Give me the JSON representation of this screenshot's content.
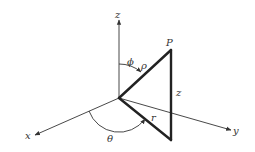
{
  "diagram": {
    "labels": {
      "z_axis": "z",
      "x_axis": "x",
      "y_axis": "y",
      "point": "P",
      "phi": "ϕ",
      "rho": "ρ",
      "z_side": "z",
      "r": "r",
      "theta": "θ"
    },
    "colors": {
      "line": "#222222",
      "axis": "#333333",
      "background": "#ffffff"
    }
  }
}
